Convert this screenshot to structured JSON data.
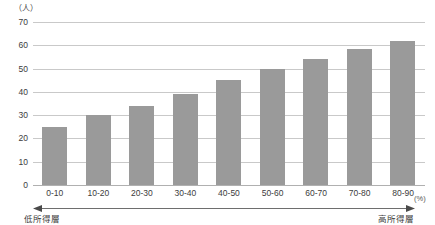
{
  "chart_data": {
    "type": "bar",
    "title": "",
    "subtitle": "",
    "xlabel": "",
    "ylabel": "",
    "x_unit": "(%)",
    "y_unit": "（人）",
    "categories": [
      "0-10",
      "10-20",
      "20-30",
      "30-40",
      "40-50",
      "50-60",
      "60-70",
      "70-80",
      "80-90"
    ],
    "values": [
      25,
      30,
      34,
      39,
      45,
      50,
      54,
      58.5,
      62
    ],
    "ylim": [
      0,
      70
    ],
    "ytick_labels": [
      "0",
      "10",
      "20",
      "30",
      "40",
      "50",
      "60",
      "70"
    ],
    "ytick_values": [
      0,
      10,
      20,
      30,
      40,
      50,
      60,
      70
    ],
    "grid": true,
    "legend": "none",
    "bar_color": "#9a9a9a",
    "gridline_color": "#c9c9c9",
    "annotations": {
      "axis_arrow": "double-headed horizontal arrow spanning the category axis",
      "left_cap": "低所得層",
      "right_cap": "高所得層"
    }
  },
  "colors": {
    "bar": "#9a9a9a",
    "grid": "#c9c9c9",
    "baseline": "#b0b0b0",
    "text": "#3c3c3c",
    "background": "#ffffff"
  }
}
